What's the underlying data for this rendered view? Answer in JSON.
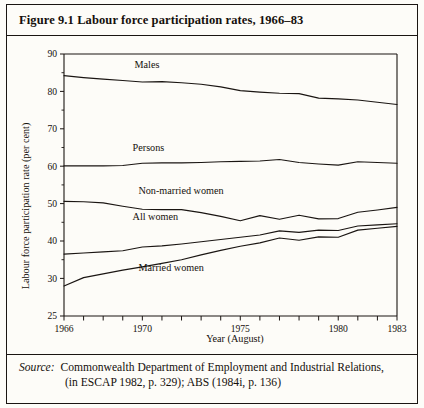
{
  "figure": {
    "number": "Figure 9.1",
    "title": "Figure 9.1  Labour force participation rates, 1966–83"
  },
  "source": {
    "label": "Source:",
    "line1": "Commonwealth Department of Employment and Industrial Relations,",
    "line2": "(in ESCAP 1982, p. 329); ABS (1984i, p. 136)"
  },
  "chart_data": {
    "type": "line",
    "title": "Labour force participation rates, 1966–83",
    "xlabel": "Year (August)",
    "ylabel": "Labour force participation rate (per cent)",
    "xlim": [
      1966,
      1983
    ],
    "ylim": [
      25,
      90
    ],
    "grid": false,
    "legend": "inline-labels",
    "y_ticks": [
      25,
      30,
      40,
      50,
      60,
      70,
      80,
      90
    ],
    "y_tick_labels": [
      "25",
      "30",
      "40",
      "50",
      "60",
      "70",
      "80",
      "90"
    ],
    "y_minor_ticks": [
      35,
      45,
      55,
      65,
      75,
      85
    ],
    "x_ticks": [
      1966,
      1967,
      1968,
      1969,
      1970,
      1971,
      1972,
      1973,
      1974,
      1975,
      1976,
      1977,
      1978,
      1979,
      1980,
      1981,
      1982,
      1983
    ],
    "x_tick_labels": {
      "1966": "1966",
      "1970": "1970",
      "1975": "1975",
      "1980": "1980",
      "1983": "1983"
    },
    "x": [
      1966,
      1967,
      1968,
      1969,
      1970,
      1971,
      1972,
      1973,
      1974,
      1975,
      1976,
      1977,
      1978,
      1979,
      1980,
      1981,
      1982,
      1983
    ],
    "series": [
      {
        "name": "Males",
        "label": "Males",
        "label_x": 1969.6,
        "label_y": 86.2,
        "values": [
          84.2,
          83.7,
          83.3,
          82.9,
          82.5,
          82.6,
          82.3,
          81.9,
          81.2,
          80.2,
          79.8,
          79.5,
          79.4,
          78.2,
          78.0,
          77.7,
          77.1,
          76.5
        ]
      },
      {
        "name": "Persons",
        "label": "Persons",
        "label_x": 1969.5,
        "label_y": 64.0,
        "values": [
          60.1,
          60.1,
          60.1,
          60.2,
          60.8,
          60.9,
          60.9,
          61.0,
          61.2,
          61.3,
          61.4,
          61.8,
          61.0,
          60.6,
          60.3,
          61.2,
          61.0,
          60.8
        ]
      },
      {
        "name": "Non-married women",
        "label": "Non-married women",
        "label_x": 1969.8,
        "label_y": 52.7,
        "values": [
          50.6,
          50.5,
          50.2,
          49.3,
          48.5,
          48.4,
          48.4,
          47.6,
          46.6,
          45.4,
          46.8,
          45.8,
          46.9,
          45.9,
          46.0,
          47.7,
          48.3,
          49.0
        ]
      },
      {
        "name": "All women",
        "label": "All women",
        "label_x": 1969.5,
        "label_y": 45.6,
        "values": [
          36.5,
          36.8,
          37.1,
          37.4,
          38.4,
          38.7,
          39.2,
          39.8,
          40.4,
          41.0,
          41.6,
          42.7,
          42.3,
          42.9,
          42.8,
          44.0,
          44.3,
          44.6
        ]
      },
      {
        "name": "Married women",
        "label": "Married women",
        "label_x": 1969.8,
        "label_y": 32.0,
        "values": [
          29.0,
          30.2,
          31.2,
          32.2,
          33.1,
          34.0,
          35.0,
          36.3,
          37.5,
          38.6,
          39.5,
          40.8,
          40.2,
          41.1,
          41.0,
          42.9,
          43.4,
          43.9
        ]
      }
    ]
  }
}
